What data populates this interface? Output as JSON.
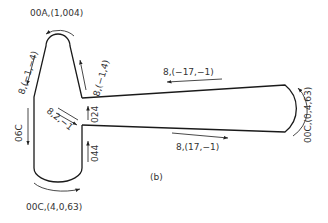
{
  "figure": {
    "caption": "(b)",
    "labels": {
      "top_arc": "00A,(1,004)",
      "left_upper": "8,(−1,−4)",
      "right_upper": "8,(−1,4)",
      "left_vertical": "06C",
      "diagonal": "8,2,−1",
      "arm_vertical_upper": "024",
      "arm_vertical_lower": "044",
      "arm_top": "8,(−17,−1)",
      "arm_bottom": "8,(17,−1)",
      "right_arc": "00C,(0,4,63)",
      "bottom_arc": "00C,(4,0,63)"
    }
  }
}
